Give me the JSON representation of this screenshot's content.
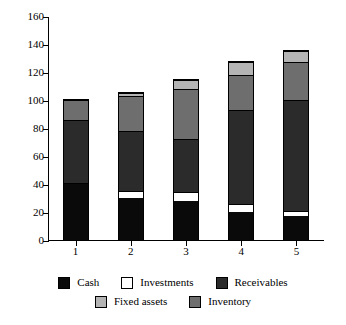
{
  "chart_data": {
    "type": "bar",
    "stacked": true,
    "title": "",
    "xlabel": "",
    "ylabel": "",
    "categories": [
      "1",
      "2",
      "3",
      "4",
      "5"
    ],
    "ylim": [
      0,
      160
    ],
    "yticks": [
      0,
      20,
      40,
      60,
      80,
      100,
      120,
      140,
      160
    ],
    "ytick_labels": [
      "0",
      "20",
      "40",
      "60",
      "80",
      "100",
      "120",
      "140",
      "160"
    ],
    "grid": false,
    "legend_position": "bottom",
    "series": [
      {
        "name": "Cash",
        "color": "#0a0a0a",
        "values": [
          40,
          30,
          28,
          20,
          17
        ]
      },
      {
        "name": "Investments",
        "color": "#ffffff",
        "values": [
          1,
          5,
          6,
          6,
          4
        ]
      },
      {
        "name": "Receivables",
        "color": "#2b2b2b",
        "values": [
          45,
          43,
          38,
          67,
          79
        ]
      },
      {
        "name": "Inventory",
        "color": "#6e6e6e",
        "values": [
          14,
          25,
          36,
          25,
          27
        ]
      },
      {
        "name": "Fixed assets",
        "color": "#b4b4b4",
        "values": [
          0,
          2,
          6,
          9,
          8
        ]
      }
    ],
    "totals": [
      100,
      105,
      114,
      127,
      135
    ]
  },
  "legend": {
    "rows": [
      [
        {
          "label": "Cash",
          "color": "#0a0a0a"
        },
        {
          "label": "Investments",
          "color": "#ffffff"
        },
        {
          "label": "Receivables",
          "color": "#2b2b2b"
        }
      ],
      [
        {
          "label": "Fixed assets",
          "color": "#b4b4b4"
        },
        {
          "label": "Inventory",
          "color": "#6e6e6e"
        }
      ]
    ]
  }
}
